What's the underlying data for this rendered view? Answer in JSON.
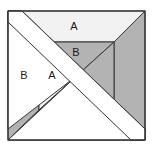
{
  "figure": {
    "title": "",
    "canvas": {
      "width": 153,
      "height": 151,
      "background": "#ffffff"
    },
    "colors": {
      "light_fill": "#f2f2f2",
      "mid_gray_fill": "#b3b3b3",
      "dark_gray_fill": "#a8a8a8",
      "white_fill": "#ffffff",
      "outline": "#333333",
      "label_text": "#1a1a1a"
    },
    "outer_square": {
      "left": 8,
      "top": 11,
      "right": 145,
      "bottom": 140
    },
    "inner_square": {
      "left": 39,
      "top": 42,
      "right": 114,
      "bottom": 110
    },
    "labels": [
      {
        "id": "label-top-trapezoid",
        "text": "A",
        "x": 74,
        "y": 27
      },
      {
        "id": "label-inner-top-triangle",
        "text": "B",
        "x": 76,
        "y": 53
      },
      {
        "id": "label-left-trapezoid",
        "text": "B",
        "x": 24,
        "y": 76
      },
      {
        "id": "label-inner-left-triangle",
        "text": "A",
        "x": 52,
        "y": 76
      }
    ],
    "pieces": [
      {
        "id": "top-trapezoid",
        "label": "A",
        "fill": "#f2f2f2"
      },
      {
        "id": "left-trapezoid",
        "label": "B",
        "fill": "#b3b3b3"
      },
      {
        "id": "right-trapezoid",
        "label": "",
        "fill": "#b3b3b3"
      },
      {
        "id": "bottom-trapezoid",
        "label": "",
        "fill": "#b3b3b3"
      },
      {
        "id": "inner-top-triangle",
        "label": "B",
        "fill": "#b3b3b3"
      },
      {
        "id": "inner-left-triangle",
        "label": "A",
        "fill": "#f2f2f2"
      },
      {
        "id": "inner-bottom-triangle",
        "label": "",
        "fill": "#a8a8a8"
      },
      {
        "id": "inner-right-triangle",
        "label": "",
        "fill": "#b3b3b3"
      },
      {
        "id": "diagonal-bowtie-overlay",
        "label": "",
        "fill": "#ffffff"
      }
    ]
  }
}
